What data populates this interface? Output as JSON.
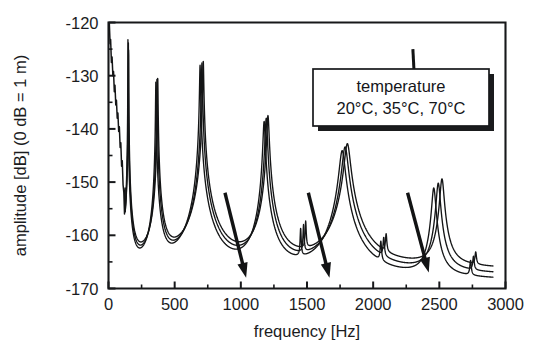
{
  "chart_data": {
    "type": "line",
    "title": "",
    "xlabel": "frequency [Hz]",
    "ylabel": "amplitude [dB] (0 dB = 1 m)",
    "xlim": [
      0,
      3000
    ],
    "ylim": [
      -170,
      -120
    ],
    "xticks": [
      0,
      500,
      1000,
      1500,
      2000,
      2500,
      3000
    ],
    "xticklabels": [
      "0",
      "500",
      "1000",
      "1500",
      "2000",
      "2500",
      "3000"
    ],
    "yticks": [
      -170,
      -160,
      -150,
      -140,
      -130,
      -120
    ],
    "yticklabels": [
      "-170",
      "-160",
      "-150",
      "-140",
      "-130",
      "-120"
    ],
    "y_minor_tick_step": 5,
    "grid": false,
    "legend_position": "upper-right-inside",
    "legend": {
      "title": "temperature",
      "entries": [
        "20°C",
        "35°C",
        "70°C"
      ],
      "separator": ",  "
    },
    "annotations": [
      {
        "name": "arrow-1000hz",
        "type": "arrow",
        "meaning": "increasing temperature",
        "x_start": 880,
        "y_start": -152,
        "x_end": 1040,
        "y_end": -168
      },
      {
        "name": "arrow-1650hz",
        "type": "arrow",
        "meaning": "increasing temperature",
        "x_start": 1510,
        "y_start": -152,
        "x_end": 1670,
        "y_end": -168
      },
      {
        "name": "arrow-2400hz",
        "type": "arrow",
        "meaning": "increasing temperature",
        "x_start": 2260,
        "y_start": -152,
        "x_end": 2420,
        "y_end": -167
      },
      {
        "name": "legend-leader-line",
        "type": "leader",
        "x_start": 2300,
        "y_start": -125,
        "x_end": 2330,
        "y_end": -139
      }
    ],
    "baseline_db": -170,
    "series": [
      {
        "name": "20°C",
        "color": "#141516",
        "shift_hz": 0,
        "resonances": [
          {
            "f": 152,
            "peak_db": -122.0,
            "q": 150
          },
          {
            "f": 372,
            "peak_db": -130.2,
            "q": 95
          },
          {
            "f": 716,
            "peak_db": -127.2,
            "q": 110
          },
          {
            "f": 1205,
            "peak_db": -137.5,
            "q": 80
          },
          {
            "f": 1490,
            "peak_db": -159.0,
            "q": 190
          },
          {
            "f": 1805,
            "peak_db": -142.8,
            "q": 45
          },
          {
            "f": 2098,
            "peak_db": -162.5,
            "q": 200
          },
          {
            "f": 2520,
            "peak_db": -149.5,
            "q": 90
          },
          {
            "f": 2775,
            "peak_db": -167.0,
            "q": 240
          }
        ],
        "floor_db": -166.5
      },
      {
        "name": "35°C",
        "color": "#141516",
        "shift_hz": -18,
        "resonances": [
          {
            "f": 150,
            "peak_db": -122.4,
            "q": 150
          },
          {
            "f": 366,
            "peak_db": -130.6,
            "q": 95
          },
          {
            "f": 706,
            "peak_db": -127.6,
            "q": 110
          },
          {
            "f": 1192,
            "peak_db": -138.0,
            "q": 80
          },
          {
            "f": 1474,
            "peak_db": -159.6,
            "q": 190
          },
          {
            "f": 1788,
            "peak_db": -143.4,
            "q": 45
          },
          {
            "f": 2080,
            "peak_db": -163.0,
            "q": 200
          },
          {
            "f": 2492,
            "peak_db": -150.3,
            "q": 90
          },
          {
            "f": 2758,
            "peak_db": -167.5,
            "q": 240
          }
        ],
        "floor_db": -167.6
      },
      {
        "name": "70°C",
        "color": "#141516",
        "shift_hz": -42,
        "resonances": [
          {
            "f": 147,
            "peak_db": -122.8,
            "q": 150
          },
          {
            "f": 358,
            "peak_db": -131.0,
            "q": 95
          },
          {
            "f": 692,
            "peak_db": -128.0,
            "q": 110
          },
          {
            "f": 1176,
            "peak_db": -138.6,
            "q": 80
          },
          {
            "f": 1452,
            "peak_db": -160.3,
            "q": 190
          },
          {
            "f": 1766,
            "peak_db": -144.1,
            "q": 45
          },
          {
            "f": 2058,
            "peak_db": -163.6,
            "q": 200
          },
          {
            "f": 2458,
            "peak_db": -151.2,
            "q": 90
          },
          {
            "f": 2736,
            "peak_db": -168.0,
            "q": 240
          }
        ],
        "floor_db": -168.6
      }
    ],
    "low_frequency_noise": {
      "description": "noisy descending measurement floor from 0 to ~120 Hz",
      "points": [
        [
          6,
          -120.0
        ],
        [
          12,
          -124.0
        ],
        [
          16,
          -123.2
        ],
        [
          22,
          -127.5
        ],
        [
          27,
          -126.5
        ],
        [
          33,
          -130.0
        ],
        [
          38,
          -129.2
        ],
        [
          44,
          -133.0
        ],
        [
          49,
          -131.8
        ],
        [
          55,
          -135.5
        ],
        [
          60,
          -134.6
        ],
        [
          66,
          -138.0
        ],
        [
          71,
          -137.0
        ],
        [
          77,
          -140.5
        ],
        [
          82,
          -139.6
        ],
        [
          88,
          -143.5
        ],
        [
          93,
          -142.6
        ],
        [
          99,
          -147.0
        ],
        [
          104,
          -146.0
        ],
        [
          110,
          -150.5
        ],
        [
          116,
          -152.0
        ],
        [
          121,
          -156.0
        ],
        [
          126,
          -151.0
        ]
      ]
    }
  }
}
